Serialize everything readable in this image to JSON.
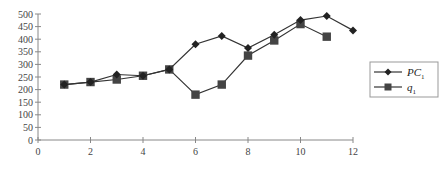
{
  "chart_data": {
    "type": "line",
    "title": "",
    "xlabel": "",
    "ylabel": "",
    "xlim": [
      0,
      12
    ],
    "ylim": [
      0,
      500
    ],
    "x_ticks": [
      0,
      2,
      4,
      6,
      8,
      10,
      12
    ],
    "y_ticks": [
      0,
      50,
      100,
      150,
      200,
      250,
      300,
      350,
      400,
      450,
      500
    ],
    "grid": false,
    "legend_position": "right",
    "series": [
      {
        "name": "PC1",
        "label_main": "PC",
        "label_sub": "1",
        "marker": "diamond",
        "color": "#222222",
        "x": [
          1,
          2,
          3,
          4,
          5,
          6,
          7,
          8,
          9,
          10,
          11,
          12
        ],
        "values": [
          220,
          230,
          260,
          255,
          280,
          380,
          413,
          365,
          418,
          476,
          492,
          435
        ]
      },
      {
        "name": "q1",
        "label_main": "q",
        "label_sub": "1",
        "marker": "square",
        "color": "#444444",
        "x": [
          1,
          2,
          3,
          4,
          5,
          6,
          7,
          8,
          9,
          10,
          11
        ],
        "values": [
          220,
          230,
          240,
          255,
          280,
          180,
          220,
          335,
          395,
          460,
          410
        ]
      }
    ]
  }
}
